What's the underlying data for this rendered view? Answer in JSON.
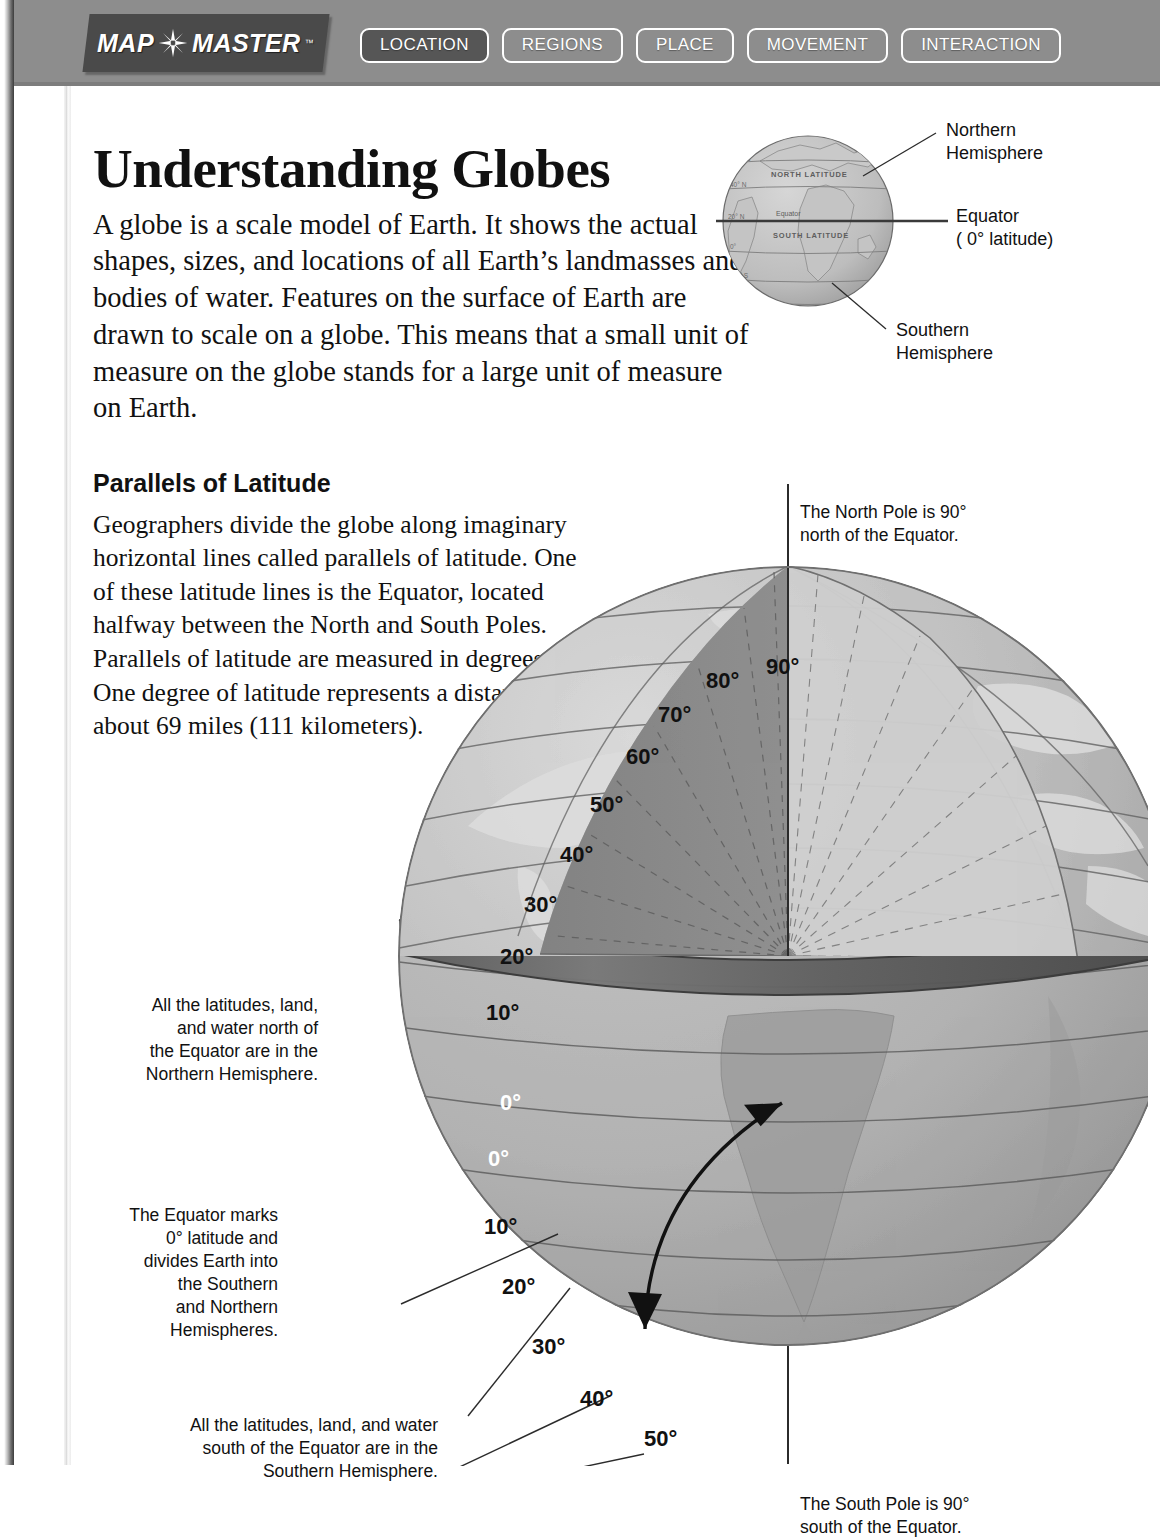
{
  "header": {
    "logo": {
      "part1": "MAP",
      "part2": "MASTER",
      "trademark": "™",
      "star_icon": "compass-rose-star-icon"
    },
    "tabs": [
      {
        "label": "LOCATION",
        "active": true
      },
      {
        "label": "REGIONS",
        "active": false
      },
      {
        "label": "PLACE",
        "active": false
      },
      {
        "label": "MOVEMENT",
        "active": false
      },
      {
        "label": "INTERACTION",
        "active": false
      }
    ],
    "bar_color": "#8d8d8d",
    "active_tab_color": "#565656"
  },
  "page": {
    "title": "Understanding Globes",
    "intro": "A globe is a scale model of Earth. It shows the actual shapes, sizes, and locations of all Earth’s landmasses and bodies of water. Features on the surface of Earth are drawn to scale on a globe. This means that a small unit of measure on the globe stands for a large unit of measure on Earth.",
    "section_heading": "Parallels of Latitude",
    "section_body": "Geographers divide the globe along imaginary horizontal lines called parallels of latitude. One of these latitude lines is the Equator, located halfway between the North and South Poles. Parallels of latitude are measured in degrees (°). One degree of latitude represents a distance of about 69 miles (111 kilometers)."
  },
  "inset_globe": {
    "labels": {
      "northern": "Northern\nHemisphere",
      "equator": "Equator\n( 0° latitude)",
      "southern": "Southern\nHemisphere"
    },
    "map_text": {
      "north_latitude": "NORTH  LATITUDE",
      "south_latitude": "SOUTH  LATITUDE",
      "equator_line": "Equator"
    },
    "gridlines": [
      "60° N",
      "40° N",
      "20° N",
      "0°",
      "20° S",
      "40° S",
      "60° S"
    ]
  },
  "figure": {
    "north_pole_note": "The North Pole is 90°\nnorth of the Equator.",
    "south_pole_note": "The South Pole is 90°\nsouth of the Equator.",
    "callout_north": "All the latitudes, land,\nand water north of\nthe Equator are in the\nNorthern Hemisphere.",
    "callout_equator": "The Equator marks\n0° latitude and\ndivides Earth into\nthe Southern\nand Northern\nHemispheres.",
    "callout_south": "All the latitudes, land, and water\nsouth of the Equator are in the\nSouthern Hemisphere.",
    "northern_degrees": [
      "90°",
      "80°",
      "70°",
      "60°",
      "50°",
      "40°",
      "30°",
      "20°",
      "10°"
    ],
    "equator_degrees": [
      "0°",
      "0°"
    ],
    "southern_degrees": [
      "10°",
      "20°",
      "30°",
      "40°",
      "50°"
    ],
    "arc_arrow_icon": "double-headed-arc-arrow-icon",
    "axis_icon": "polar-axis-line-icon",
    "colors": {
      "ocean": "#b2b2b2",
      "ocean_dark": "#9c9c9c",
      "land": "#d8d8d8",
      "wedge": "#8a8a8a",
      "wedge_dark": "#7a7a7a",
      "interior_light": "#cacaca",
      "equator_band": "#6a6a6a",
      "gridline": "#6e6e6e"
    }
  }
}
